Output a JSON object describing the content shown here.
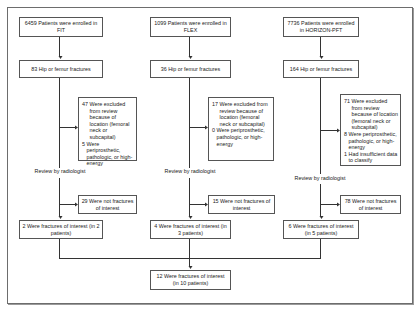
{
  "diagram": {
    "type": "flowchart",
    "columns": [
      {
        "trial": "FIT",
        "enrolled": "6459 Patients were enrolled in FIT",
        "fractures": "83 Hip or femur fractures",
        "excluded": [
          {
            "num": "47",
            "text": "Were excluded from review because of location (femoral neck or subcapital)"
          },
          {
            "num": "5",
            "text": "Were periprosthetic, pathologic, or high-energy"
          }
        ],
        "review": "Review by radiologist",
        "not_interest": "29 Were not fractures of interest",
        "interest": "2 Were fractures of interest (in 2 patients)"
      },
      {
        "trial": "FLEX",
        "enrolled": "1099 Patients were enrolled in FLEX",
        "fractures": "36 Hip or femur fractures",
        "excluded": [
          {
            "num": "17",
            "text": "Were excluded from review because of location (femoral neck or subcapital)"
          },
          {
            "num": "0",
            "text": "Were periprosthetic, pathologic, or high-energy"
          }
        ],
        "review": "Review by radiologist",
        "not_interest": "15 Were not fractures of interest",
        "interest": "4 Were fractures of interest (in 3 patients)"
      },
      {
        "trial": "HORIZON-PFT",
        "enrolled": "7736 Patients were enrolled in HORIZON-PFT",
        "fractures": "164 Hip or femur fractures",
        "excluded": [
          {
            "num": "71",
            "text": "Were excluded from review because of location (femoral neck or subcapital)"
          },
          {
            "num": "8",
            "text": "Were periprosthetic, pathologic, or high-energy"
          },
          {
            "num": "1",
            "text": "Had insufficient data to classify"
          }
        ],
        "review": "Review by radiologist",
        "not_interest": "78 Were not fractures of interest",
        "interest": "6 Were fractures of interest (in 5 patients)"
      }
    ],
    "total": "12 Were fractures of interest (in 10 patients)"
  }
}
